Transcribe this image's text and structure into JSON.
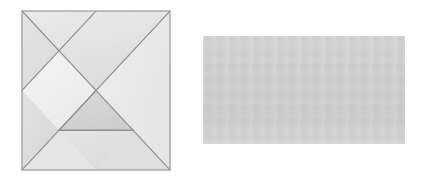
{
  "scene": {
    "title": "Tangram puzzle square beside a plain gray rectangle",
    "background_color": "#ffffff",
    "width": 424,
    "height": 181,
    "figure_count": 2
  },
  "figures": [
    {
      "id": "tangram",
      "label": "tangram-square",
      "shape": "square",
      "x": 22,
      "y": 11,
      "width": 148,
      "height": 159,
      "outline_color": "#9a9a9a",
      "fill_color": "#e3e3e3",
      "piece_count": 7,
      "description": "Seven-piece tangram dissection of a square"
    },
    {
      "id": "rectangle",
      "label": "gray-rectangle",
      "shape": "rectangle",
      "x": 203,
      "y": 36,
      "width": 202,
      "height": 108,
      "fill_color": "#cccccc",
      "outline_color": "none",
      "description": "Solid light gray rectangle with faint paper texture"
    }
  ],
  "tangram_pieces": [
    {
      "name": "large-triangle-upper-left",
      "type": "large triangle",
      "fill": "#e6e6e6",
      "points": "0,0 148,0 74,74"
    },
    {
      "name": "large-triangle-right",
      "type": "large triangle",
      "fill": "#ededed",
      "points": "148,0 148,148 74,74"
    },
    {
      "name": "medium-triangle-lower-left",
      "type": "medium triangle",
      "fill": "#e0e0e0",
      "points": "0,0 0,74 37,37"
    },
    {
      "name": "square-diamond",
      "type": "square",
      "fill": "#f2f2f2",
      "points": "37,37 74,74 37,111 0,74"
    },
    {
      "name": "small-triangle-center",
      "type": "small triangle",
      "fill": "#d6d6d6",
      "points": "74,74 111,111 37,111"
    },
    {
      "name": "small-triangle-bottom",
      "type": "small triangle",
      "fill": "#e2e2e2",
      "points": "37,111 111,111 74,148"
    },
    {
      "name": "parallelogram-lower-left",
      "type": "parallelogram",
      "fill": "#dedede",
      "points": "0,74 37,111 0,148"
    }
  ],
  "colors": {
    "page_background": "#ffffff",
    "tangram_line": "#8e8e8e",
    "tangram_border": "#9a9a9a",
    "tangram_light_fill": "#f1f1f1",
    "tangram_mid_fill": "#e4e4e4",
    "tangram_dark_fill": "#d4d4d4",
    "rectangle_fill": "#cccccc"
  }
}
